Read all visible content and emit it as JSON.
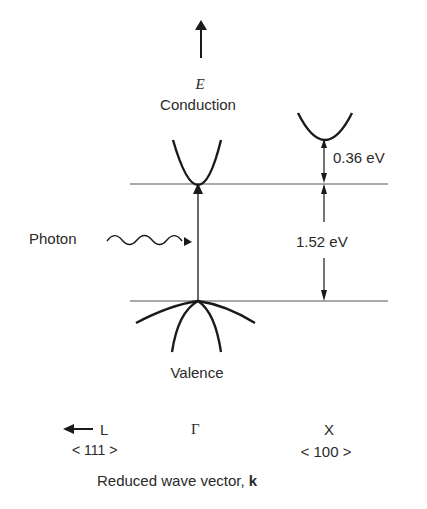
{
  "diagram": {
    "axis_label_energy": "E",
    "band_conduction_label": "Conduction",
    "band_valence_label": "Valence",
    "photon_label": "Photon",
    "gap_direct": "1.52 eV",
    "gap_x_offset": "0.36 eV",
    "k_points": {
      "L": "L",
      "L_direction": "< 111 >",
      "Gamma": "Γ",
      "X": "X",
      "X_direction": "< 100 >"
    },
    "x_axis_title": "Reduced wave vector, ",
    "x_axis_symbol": "k"
  }
}
